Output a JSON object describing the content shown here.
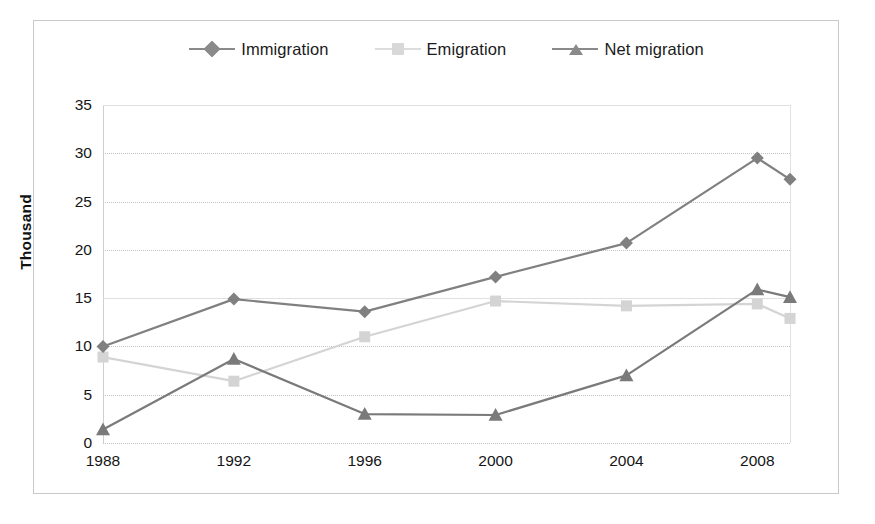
{
  "chart_data": {
    "type": "line",
    "title": "",
    "xlabel": "",
    "ylabel": "Thousand",
    "xlim": [
      1988,
      2009
    ],
    "ylim": [
      0,
      35
    ],
    "ytick_step": 5,
    "yticks": [
      0,
      5,
      10,
      15,
      20,
      25,
      30,
      35
    ],
    "xticks": [
      1988,
      1992,
      1996,
      2000,
      2004,
      2008
    ],
    "x": [
      1988,
      1992,
      1996,
      2000,
      2004,
      2008,
      2009
    ],
    "grid": true,
    "legend_position": "top",
    "series": [
      {
        "name": "Immigration",
        "marker": "diamond",
        "color": "#808080",
        "values": [
          10.0,
          14.9,
          13.6,
          17.2,
          20.7,
          29.5,
          27.3
        ]
      },
      {
        "name": "Emigration",
        "marker": "square",
        "color": "#d4d4d4",
        "values": [
          8.9,
          6.4,
          11.0,
          14.7,
          14.2,
          14.4,
          12.9
        ]
      },
      {
        "name": "Net migration",
        "marker": "triangle",
        "color": "#7a7a7a",
        "values": [
          1.4,
          8.7,
          3.0,
          2.9,
          7.0,
          15.9,
          15.1
        ]
      }
    ]
  },
  "axes": {
    "y_title": "Thousand",
    "y_tick_labels": [
      "35",
      "30",
      "25",
      "20",
      "15",
      "10",
      "5",
      "0"
    ],
    "x_tick_labels": [
      "1988",
      "1992",
      "1996",
      "2000",
      "2004",
      "2008"
    ]
  },
  "legend": {
    "items": [
      {
        "label": "Immigration",
        "marker": "diamond-marker",
        "color": "#808080"
      },
      {
        "label": "Emigration",
        "marker": "square-marker",
        "color": "#d4d4d4"
      },
      {
        "label": "Net migration",
        "marker": "triangle-marker",
        "color": "#7a7a7a"
      }
    ]
  },
  "colors": {
    "immigration": "#808080",
    "emigration": "#d4d4d4",
    "net_migration": "#7a7a7a",
    "grid": "#c4c4c4",
    "frame": "#c9c9c9",
    "background": "#ffffff",
    "text": "#151515"
  }
}
